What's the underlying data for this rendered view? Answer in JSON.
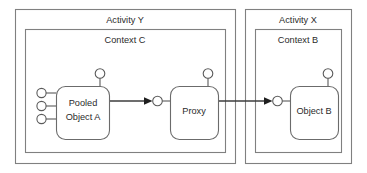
{
  "diagram": {
    "background_color": "#ffffff",
    "border_color": "#808080",
    "node_border_color": "#6b6b6b",
    "line_color": "#3d3d3d",
    "text_color": "#2b2b2b"
  },
  "activities": [
    {
      "id": "activity-y",
      "label": "Activity Y",
      "context": {
        "id": "context-c",
        "label": "Context C"
      }
    },
    {
      "id": "activity-x",
      "label": "Activity X",
      "context": {
        "id": "context-b",
        "label": "Context B"
      }
    }
  ],
  "nodes": [
    {
      "id": "pooled-object-a",
      "label_line1": "Pooled",
      "label_line2": "Object A",
      "provided_interfaces_left": 3,
      "top_interface": true
    },
    {
      "id": "proxy",
      "label_line1": "Proxy",
      "label_line2": "",
      "provided_interfaces_left": 0,
      "top_interface": true
    },
    {
      "id": "object-b",
      "label_line1": "Object B",
      "label_line2": "",
      "provided_interfaces_left": 0,
      "top_interface": true
    }
  ],
  "connectors": [
    {
      "id": "connector-a-to-proxy",
      "from": "pooled-object-a",
      "to": "proxy",
      "arrow": "filled"
    },
    {
      "id": "connector-proxy-to-object-b",
      "from": "proxy",
      "to": "object-b",
      "arrow": "filled"
    }
  ]
}
